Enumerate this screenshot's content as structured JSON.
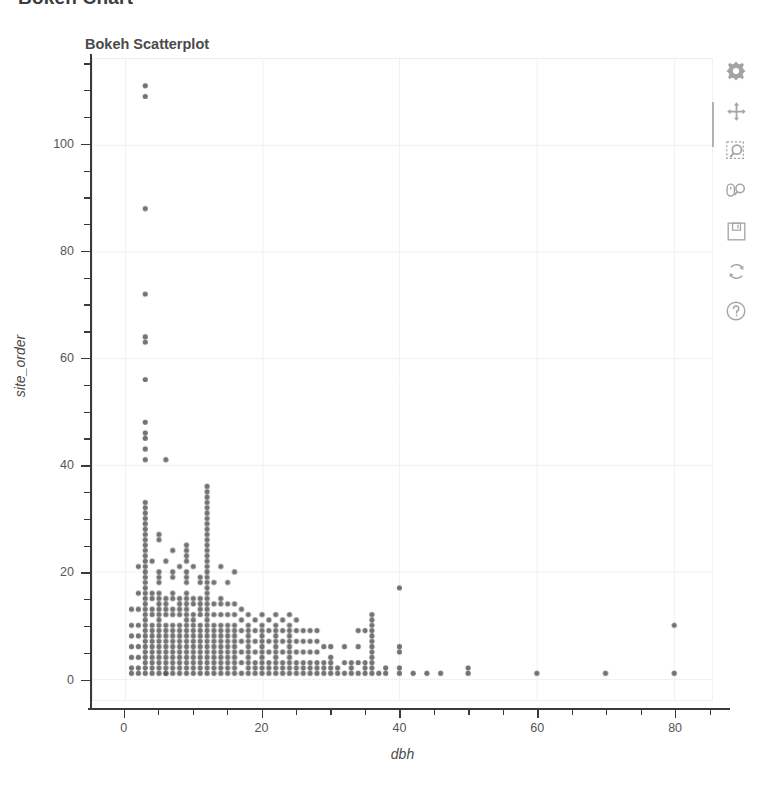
{
  "page": {
    "header_title": "Bokeh Chart",
    "background": "#ffffff"
  },
  "chart_data": {
    "type": "scatter",
    "title": "Bokeh Scatterplot",
    "xlabel": "dbh",
    "ylabel": "site_order",
    "xlim": [
      -4.6,
      85.5
    ],
    "ylim": [
      -4,
      116
    ],
    "xticks": [
      0,
      20,
      40,
      60,
      80
    ],
    "yticks": [
      0,
      20,
      40,
      60,
      80,
      100
    ],
    "x_minor_step": 5,
    "y_minor_step": 5,
    "grid": true,
    "grid_color": "#f0f0f0",
    "legend": null,
    "marker": {
      "shape": "circle",
      "size": 5.2,
      "color": "#5b5b5b",
      "alpha": 0.85
    },
    "points": [
      [
        3,
        111
      ],
      [
        3,
        109
      ],
      [
        3,
        88
      ],
      [
        3,
        72
      ],
      [
        3,
        64
      ],
      [
        3,
        63
      ],
      [
        3,
        56
      ],
      [
        3,
        48
      ],
      [
        3,
        46
      ],
      [
        3,
        45
      ],
      [
        3,
        43
      ],
      [
        3,
        41
      ],
      [
        6,
        41
      ],
      [
        12,
        36
      ],
      [
        12,
        35
      ],
      [
        12,
        34
      ],
      [
        12,
        33
      ],
      [
        3,
        33
      ],
      [
        3,
        32
      ],
      [
        3,
        31
      ],
      [
        12,
        32
      ],
      [
        12,
        31
      ],
      [
        12,
        30
      ],
      [
        3,
        30
      ],
      [
        3,
        29
      ],
      [
        3,
        28
      ],
      [
        3,
        27
      ],
      [
        12,
        29
      ],
      [
        12,
        28
      ],
      [
        12,
        27
      ],
      [
        12,
        26
      ],
      [
        3,
        26
      ],
      [
        3,
        25
      ],
      [
        3,
        24
      ],
      [
        5,
        27
      ],
      [
        5,
        26
      ],
      [
        7,
        24
      ],
      [
        9,
        25
      ],
      [
        9,
        24
      ],
      [
        9,
        23
      ],
      [
        9,
        22
      ],
      [
        12,
        25
      ],
      [
        12,
        24
      ],
      [
        12,
        23
      ],
      [
        12,
        22
      ],
      [
        3,
        23
      ],
      [
        3,
        22
      ],
      [
        3,
        21
      ],
      [
        2,
        21
      ],
      [
        4,
        22
      ],
      [
        6,
        22
      ],
      [
        8,
        21
      ],
      [
        10,
        21
      ],
      [
        14,
        21
      ],
      [
        16,
        20
      ],
      [
        3,
        20
      ],
      [
        3,
        19
      ],
      [
        3,
        18
      ],
      [
        3,
        17
      ],
      [
        5,
        20
      ],
      [
        5,
        19
      ],
      [
        5,
        18
      ],
      [
        7,
        20
      ],
      [
        7,
        19
      ],
      [
        9,
        20
      ],
      [
        9,
        19
      ],
      [
        9,
        18
      ],
      [
        11,
        19
      ],
      [
        11,
        18
      ],
      [
        12,
        21
      ],
      [
        12,
        20
      ],
      [
        12,
        19
      ],
      [
        12,
        18
      ],
      [
        13,
        18
      ],
      [
        15,
        18
      ],
      [
        40,
        17
      ],
      [
        2,
        16
      ],
      [
        3,
        16
      ],
      [
        3,
        15
      ],
      [
        3,
        14
      ],
      [
        4,
        16
      ],
      [
        4,
        15
      ],
      [
        5,
        16
      ],
      [
        5,
        15
      ],
      [
        5,
        14
      ],
      [
        6,
        15
      ],
      [
        6,
        14
      ],
      [
        7,
        16
      ],
      [
        7,
        15
      ],
      [
        8,
        15
      ],
      [
        8,
        14
      ],
      [
        9,
        16
      ],
      [
        9,
        15
      ],
      [
        9,
        14
      ],
      [
        10,
        15
      ],
      [
        10,
        14
      ],
      [
        11,
        15
      ],
      [
        11,
        14
      ],
      [
        12,
        17
      ],
      [
        12,
        16
      ],
      [
        12,
        15
      ],
      [
        12,
        14
      ],
      [
        13,
        14
      ],
      [
        14,
        15
      ],
      [
        14,
        14
      ],
      [
        15,
        14
      ],
      [
        16,
        14
      ],
      [
        17,
        13
      ],
      [
        1,
        13
      ],
      [
        2,
        13
      ],
      [
        3,
        13
      ],
      [
        3,
        12
      ],
      [
        3,
        11
      ],
      [
        4,
        13
      ],
      [
        4,
        12
      ],
      [
        5,
        13
      ],
      [
        5,
        12
      ],
      [
        5,
        11
      ],
      [
        6,
        13
      ],
      [
        6,
        12
      ],
      [
        7,
        13
      ],
      [
        7,
        12
      ],
      [
        8,
        13
      ],
      [
        8,
        12
      ],
      [
        9,
        13
      ],
      [
        9,
        12
      ],
      [
        9,
        11
      ],
      [
        10,
        12
      ],
      [
        10,
        11
      ],
      [
        11,
        13
      ],
      [
        11,
        12
      ],
      [
        12,
        13
      ],
      [
        12,
        12
      ],
      [
        12,
        11
      ],
      [
        13,
        12
      ],
      [
        14,
        12
      ],
      [
        15,
        12
      ],
      [
        16,
        12
      ],
      [
        17,
        11
      ],
      [
        18,
        12
      ],
      [
        19,
        11
      ],
      [
        20,
        12
      ],
      [
        21,
        11
      ],
      [
        22,
        12
      ],
      [
        23,
        11
      ],
      [
        24,
        12
      ],
      [
        25,
        11
      ],
      [
        36,
        12
      ],
      [
        36,
        11
      ],
      [
        80,
        10
      ],
      [
        1,
        10
      ],
      [
        2,
        10
      ],
      [
        3,
        10
      ],
      [
        3,
        9
      ],
      [
        4,
        10
      ],
      [
        4,
        9
      ],
      [
        5,
        10
      ],
      [
        5,
        9
      ],
      [
        6,
        10
      ],
      [
        6,
        9
      ],
      [
        7,
        10
      ],
      [
        7,
        9
      ],
      [
        8,
        10
      ],
      [
        8,
        9
      ],
      [
        9,
        10
      ],
      [
        9,
        9
      ],
      [
        10,
        10
      ],
      [
        10,
        9
      ],
      [
        11,
        10
      ],
      [
        11,
        9
      ],
      [
        12,
        10
      ],
      [
        12,
        9
      ],
      [
        13,
        10
      ],
      [
        13,
        9
      ],
      [
        14,
        10
      ],
      [
        14,
        9
      ],
      [
        15,
        10
      ],
      [
        15,
        9
      ],
      [
        16,
        10
      ],
      [
        16,
        9
      ],
      [
        17,
        9
      ],
      [
        18,
        10
      ],
      [
        18,
        9
      ],
      [
        19,
        9
      ],
      [
        20,
        10
      ],
      [
        20,
        9
      ],
      [
        21,
        9
      ],
      [
        22,
        10
      ],
      [
        22,
        9
      ],
      [
        23,
        9
      ],
      [
        24,
        10
      ],
      [
        24,
        9
      ],
      [
        25,
        9
      ],
      [
        26,
        9
      ],
      [
        27,
        9
      ],
      [
        28,
        9
      ],
      [
        34,
        9
      ],
      [
        35,
        9
      ],
      [
        36,
        10
      ],
      [
        36,
        9
      ],
      [
        40,
        6
      ],
      [
        40,
        5
      ],
      [
        1,
        8
      ],
      [
        2,
        8
      ],
      [
        3,
        8
      ],
      [
        3,
        7
      ],
      [
        4,
        8
      ],
      [
        4,
        7
      ],
      [
        5,
        8
      ],
      [
        5,
        7
      ],
      [
        6,
        8
      ],
      [
        6,
        7
      ],
      [
        7,
        8
      ],
      [
        7,
        7
      ],
      [
        8,
        8
      ],
      [
        8,
        7
      ],
      [
        9,
        8
      ],
      [
        9,
        7
      ],
      [
        10,
        8
      ],
      [
        10,
        7
      ],
      [
        11,
        8
      ],
      [
        11,
        7
      ],
      [
        12,
        8
      ],
      [
        12,
        7
      ],
      [
        13,
        8
      ],
      [
        13,
        7
      ],
      [
        14,
        8
      ],
      [
        14,
        7
      ],
      [
        15,
        8
      ],
      [
        15,
        7
      ],
      [
        16,
        8
      ],
      [
        16,
        7
      ],
      [
        17,
        7
      ],
      [
        18,
        8
      ],
      [
        18,
        7
      ],
      [
        19,
        7
      ],
      [
        20,
        8
      ],
      [
        20,
        7
      ],
      [
        21,
        7
      ],
      [
        22,
        8
      ],
      [
        22,
        7
      ],
      [
        23,
        7
      ],
      [
        24,
        8
      ],
      [
        24,
        7
      ],
      [
        25,
        7
      ],
      [
        26,
        7
      ],
      [
        27,
        7
      ],
      [
        28,
        7
      ],
      [
        29,
        6
      ],
      [
        30,
        6
      ],
      [
        32,
        6
      ],
      [
        34,
        6
      ],
      [
        36,
        8
      ],
      [
        36,
        7
      ],
      [
        36,
        6
      ],
      [
        1,
        6
      ],
      [
        2,
        6
      ],
      [
        3,
        6
      ],
      [
        3,
        5
      ],
      [
        4,
        6
      ],
      [
        4,
        5
      ],
      [
        5,
        6
      ],
      [
        5,
        5
      ],
      [
        6,
        6
      ],
      [
        6,
        5
      ],
      [
        7,
        6
      ],
      [
        7,
        5
      ],
      [
        8,
        6
      ],
      [
        8,
        5
      ],
      [
        9,
        6
      ],
      [
        9,
        5
      ],
      [
        10,
        6
      ],
      [
        10,
        5
      ],
      [
        11,
        6
      ],
      [
        11,
        5
      ],
      [
        12,
        6
      ],
      [
        12,
        5
      ],
      [
        13,
        6
      ],
      [
        13,
        5
      ],
      [
        14,
        6
      ],
      [
        14,
        5
      ],
      [
        15,
        6
      ],
      [
        15,
        5
      ],
      [
        16,
        6
      ],
      [
        16,
        5
      ],
      [
        17,
        5
      ],
      [
        18,
        6
      ],
      [
        18,
        5
      ],
      [
        19,
        5
      ],
      [
        20,
        6
      ],
      [
        20,
        5
      ],
      [
        21,
        5
      ],
      [
        22,
        6
      ],
      [
        22,
        5
      ],
      [
        23,
        5
      ],
      [
        24,
        6
      ],
      [
        24,
        5
      ],
      [
        25,
        5
      ],
      [
        26,
        5
      ],
      [
        27,
        5
      ],
      [
        28,
        5
      ],
      [
        30,
        4
      ],
      [
        36,
        5
      ],
      [
        36,
        4
      ],
      [
        1,
        4
      ],
      [
        2,
        4
      ],
      [
        3,
        4
      ],
      [
        3,
        3
      ],
      [
        4,
        4
      ],
      [
        4,
        3
      ],
      [
        5,
        4
      ],
      [
        5,
        3
      ],
      [
        6,
        4
      ],
      [
        6,
        3
      ],
      [
        7,
        4
      ],
      [
        7,
        3
      ],
      [
        8,
        4
      ],
      [
        8,
        3
      ],
      [
        9,
        4
      ],
      [
        9,
        3
      ],
      [
        10,
        4
      ],
      [
        10,
        3
      ],
      [
        11,
        4
      ],
      [
        11,
        3
      ],
      [
        12,
        4
      ],
      [
        12,
        3
      ],
      [
        13,
        4
      ],
      [
        13,
        3
      ],
      [
        14,
        4
      ],
      [
        14,
        3
      ],
      [
        15,
        4
      ],
      [
        15,
        3
      ],
      [
        16,
        4
      ],
      [
        16,
        3
      ],
      [
        17,
        3
      ],
      [
        18,
        4
      ],
      [
        18,
        3
      ],
      [
        19,
        3
      ],
      [
        20,
        4
      ],
      [
        20,
        3
      ],
      [
        21,
        3
      ],
      [
        22,
        4
      ],
      [
        22,
        3
      ],
      [
        23,
        3
      ],
      [
        24,
        4
      ],
      [
        24,
        3
      ],
      [
        25,
        3
      ],
      [
        26,
        3
      ],
      [
        27,
        3
      ],
      [
        28,
        3
      ],
      [
        29,
        3
      ],
      [
        30,
        3
      ],
      [
        31,
        2
      ],
      [
        32,
        3
      ],
      [
        33,
        2
      ],
      [
        34,
        3
      ],
      [
        35,
        2
      ],
      [
        36,
        3
      ],
      [
        36,
        2
      ],
      [
        38,
        2
      ],
      [
        40,
        2
      ],
      [
        1,
        2
      ],
      [
        2,
        2
      ],
      [
        3,
        2
      ],
      [
        3,
        1
      ],
      [
        4,
        2
      ],
      [
        4,
        1
      ],
      [
        5,
        2
      ],
      [
        5,
        1
      ],
      [
        6,
        2
      ],
      [
        6,
        1
      ],
      [
        7,
        2
      ],
      [
        7,
        1
      ],
      [
        8,
        2
      ],
      [
        8,
        1
      ],
      [
        9,
        2
      ],
      [
        9,
        1
      ],
      [
        10,
        2
      ],
      [
        10,
        1
      ],
      [
        11,
        2
      ],
      [
        11,
        1
      ],
      [
        12,
        2
      ],
      [
        12,
        1
      ],
      [
        13,
        2
      ],
      [
        13,
        1
      ],
      [
        14,
        2
      ],
      [
        14,
        1
      ],
      [
        15,
        2
      ],
      [
        15,
        1
      ],
      [
        16,
        2
      ],
      [
        16,
        1
      ],
      [
        17,
        1
      ],
      [
        18,
        2
      ],
      [
        18,
        1
      ],
      [
        19,
        1
      ],
      [
        20,
        2
      ],
      [
        20,
        1
      ],
      [
        21,
        1
      ],
      [
        22,
        2
      ],
      [
        22,
        1
      ],
      [
        23,
        1
      ],
      [
        24,
        2
      ],
      [
        24,
        1
      ],
      [
        25,
        1
      ],
      [
        26,
        1
      ],
      [
        27,
        1
      ],
      [
        28,
        1
      ],
      [
        29,
        1
      ],
      [
        30,
        1
      ],
      [
        31,
        1
      ],
      [
        32,
        1
      ],
      [
        33,
        1
      ],
      [
        34,
        1
      ],
      [
        35,
        1
      ],
      [
        36,
        1
      ],
      [
        37,
        1
      ],
      [
        38,
        1
      ],
      [
        40,
        1
      ],
      [
        42,
        1
      ],
      [
        44,
        1
      ],
      [
        46,
        1
      ],
      [
        50,
        2
      ],
      [
        50,
        1
      ],
      [
        60,
        1
      ],
      [
        70,
        1
      ],
      [
        80,
        1
      ],
      [
        1,
        1
      ],
      [
        2,
        1
      ],
      [
        6,
        1
      ],
      [
        19,
        2
      ],
      [
        21,
        2
      ],
      [
        23,
        2
      ],
      [
        25,
        2
      ],
      [
        26,
        2
      ],
      [
        27,
        2
      ],
      [
        28,
        2
      ],
      [
        29,
        2
      ],
      [
        30,
        2
      ],
      [
        33,
        3
      ],
      [
        35,
        3
      ]
    ]
  },
  "toolbar": {
    "tools": [
      {
        "name": "bokeh-logo-icon",
        "label": "Bokeh"
      },
      {
        "name": "pan-icon",
        "label": "Pan"
      },
      {
        "name": "box-zoom-icon",
        "label": "Box Zoom"
      },
      {
        "name": "wheel-zoom-icon",
        "label": "Wheel Zoom"
      },
      {
        "name": "save-icon",
        "label": "Save"
      },
      {
        "name": "reset-icon",
        "label": "Reset"
      },
      {
        "name": "help-icon",
        "label": "Help"
      }
    ],
    "active_tool": "Pan",
    "icon_color": "#6e6e6e"
  }
}
